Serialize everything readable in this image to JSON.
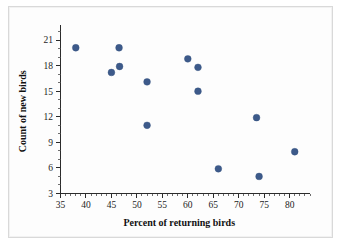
{
  "figure": {
    "name": "bird-colony-scatterplot",
    "background_color": "#ffffff",
    "frame_color": "#d9d9d9"
  },
  "chart_data": {
    "type": "scatter",
    "title": "",
    "subtitle": "",
    "xlabel": "Percent of returning birds",
    "ylabel": "Count of new birds",
    "xlim": [
      35,
      84
    ],
    "ylim": [
      3,
      22.3
    ],
    "xticks": [
      35,
      40,
      45,
      50,
      55,
      60,
      65,
      70,
      75,
      80
    ],
    "yticks": [
      3,
      6,
      9,
      12,
      15,
      18,
      21
    ],
    "xtick_labels": [
      "35",
      "40",
      "45",
      "50",
      "55",
      "60",
      "65",
      "70",
      "75",
      "80"
    ],
    "ytick_labels": [
      "3",
      "6",
      "9",
      "12",
      "15",
      "18",
      "21"
    ],
    "x_minor_step": 1,
    "y_minor_step": 1,
    "grid": false,
    "legend": false,
    "legend_position": "none",
    "marker": {
      "shape": "circle",
      "color": "#3d5a8a",
      "size": 3.4
    },
    "x": [
      38,
      45,
      46.5,
      46.6,
      52,
      52,
      60,
      62,
      62,
      66,
      73.5,
      74,
      81
    ],
    "y": [
      20.1,
      17.2,
      20.1,
      17.9,
      16.1,
      11,
      18.8,
      17.8,
      15,
      5.9,
      11.9,
      5,
      7.9
    ],
    "points": [
      {
        "x": 38,
        "y": 20.1
      },
      {
        "x": 45,
        "y": 17.2
      },
      {
        "x": 46.5,
        "y": 20.1
      },
      {
        "x": 46.6,
        "y": 17.9
      },
      {
        "x": 52,
        "y": 16.1
      },
      {
        "x": 52,
        "y": 11
      },
      {
        "x": 60,
        "y": 18.8
      },
      {
        "x": 62,
        "y": 17.8
      },
      {
        "x": 62,
        "y": 15
      },
      {
        "x": 66,
        "y": 5.9
      },
      {
        "x": 73.5,
        "y": 11.9
      },
      {
        "x": 74,
        "y": 5
      },
      {
        "x": 81,
        "y": 7.9
      }
    ]
  }
}
